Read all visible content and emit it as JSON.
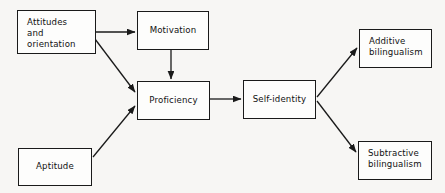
{
  "diagram": {
    "type": "flowchart",
    "background_color": "#f7f6f4",
    "box_fill_color": "#fdfdfc",
    "box_border_color": "#1a1a1a",
    "arrow_color": "#1a1a1a",
    "text_color": "#111111",
    "nodes": [
      {
        "id": "attitudes",
        "label": "Attitudes\nand\norientation",
        "align": "left",
        "x": 17,
        "y": 10,
        "width": 79,
        "height": 44
      },
      {
        "id": "motivation",
        "label": "Motivation",
        "align": "center",
        "x": 137,
        "y": 11,
        "width": 72,
        "height": 39
      },
      {
        "id": "proficiency",
        "label": "Proficiency",
        "align": "center",
        "x": 137,
        "y": 81,
        "width": 73,
        "height": 39
      },
      {
        "id": "self-identity",
        "label": "Self-identity",
        "align": "center",
        "x": 243,
        "y": 80,
        "width": 73,
        "height": 39
      },
      {
        "id": "additive",
        "label": "Additive\nbilingualism",
        "align": "left",
        "x": 359,
        "y": 29,
        "width": 73,
        "height": 39
      },
      {
        "id": "subtractive",
        "label": "Subtractive\nbilingualism",
        "align": "left",
        "x": 358,
        "y": 141,
        "width": 74,
        "height": 39
      },
      {
        "id": "aptitude",
        "label": "Aptitude",
        "align": "center",
        "x": 18,
        "y": 148,
        "width": 74,
        "height": 38
      }
    ],
    "edges": [
      {
        "id": "attitudes-to-motivation",
        "from": "attitudes",
        "to": "motivation",
        "x1": 96,
        "y1": 32,
        "x2": 135,
        "y2": 32
      },
      {
        "id": "attitudes-to-proficiency",
        "from": "attitudes",
        "to": "proficiency",
        "x1": 95,
        "y1": 39,
        "x2": 135,
        "y2": 92
      },
      {
        "id": "motivation-to-proficiency",
        "from": "motivation",
        "to": "proficiency",
        "x1": 171,
        "y1": 50,
        "x2": 171,
        "y2": 79
      },
      {
        "id": "aptitude-to-proficiency",
        "from": "aptitude",
        "to": "proficiency",
        "x1": 93,
        "y1": 157,
        "x2": 135,
        "y2": 106
      },
      {
        "id": "proficiency-to-self-identity",
        "from": "proficiency",
        "to": "self-identity",
        "x1": 210,
        "y1": 99,
        "x2": 241,
        "y2": 99
      },
      {
        "id": "self-identity-to-additive",
        "from": "self-identity",
        "to": "additive",
        "x1": 317,
        "y1": 97,
        "x2": 357,
        "y2": 48
      },
      {
        "id": "self-identity-to-subtractive",
        "from": "self-identity",
        "to": "subtractive",
        "x1": 317,
        "y1": 101,
        "x2": 356,
        "y2": 152
      }
    ]
  }
}
